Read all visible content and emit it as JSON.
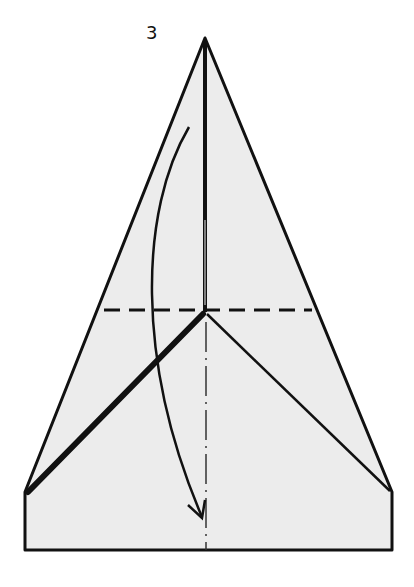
{
  "diagram": {
    "step_number": "3",
    "colors": {
      "paper_fill": "#ececec",
      "line": "#111111",
      "background": "#ffffff"
    },
    "elements": {
      "outline": "Paper shape: pointed triangle on top of a rectangle",
      "apex": [
        205,
        38
      ],
      "left_corner": [
        25,
        492
      ],
      "right_corner": [
        392,
        492
      ],
      "rectangle_bottom_y": 550,
      "center_crease": "Vertical solid center fold from apex to center point",
      "center_point": [
        205,
        312
      ],
      "valley_fold_line": "Horizontal dashed line at y=310 (fold here)",
      "mountain_fold_line": "Vertical dash-dot line from center point to bottom",
      "thick_flap_edge": "Thick line from center point to left corner",
      "thin_flap_edge": "Thin line from center point to right corner",
      "fold_arrow": "Curved arrow from upper point down to bottom center indicating fold down"
    }
  }
}
